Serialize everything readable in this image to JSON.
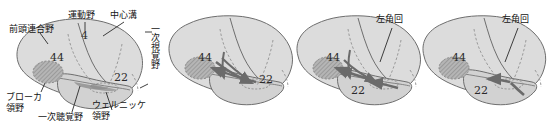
{
  "figure": {
    "title": "",
    "colors": {
      "cortex_fill": "#dcdcdc",
      "cortex_stroke": "#6e6e6e",
      "temporal_fill": "#d2d2d2",
      "broca_fill": "#a8a8a8",
      "broca_stroke": "#8a8a8a",
      "arrow": "#6b6b6b",
      "sulcus_dashed": "#9a9a9a",
      "leader_line": "#2a2a2a",
      "text": "#141414",
      "background": "#ffffff"
    }
  },
  "panels": [
    {
      "id": "panel-1",
      "name": "labeled-brain-anatomy",
      "labels": {
        "frontal_association": "前頭連合野",
        "motor": "運動野",
        "central_sulcus": "中心溝",
        "primary_visual": "一次視覚野",
        "broca": "ブローカ\n領野",
        "primary_auditory": "一次聴覚野",
        "wernicke": "ウェルニッケ\n領野"
      },
      "numbers": {
        "area_4": "4",
        "area_44": "44",
        "area_22": "22"
      }
    },
    {
      "id": "panel-2",
      "name": "brain-hearing-speech-flow",
      "labels": {},
      "numbers": {
        "area_44": "44",
        "area_22": "22"
      }
    },
    {
      "id": "panel-3",
      "name": "brain-reading-flow",
      "labels": {
        "angular_gyrus": "左角回"
      },
      "numbers": {
        "area_44": "44",
        "area_22": "22"
      }
    },
    {
      "id": "panel-4",
      "name": "brain-angular-to-wernicke-flow",
      "labels": {
        "angular_gyrus": "左角回"
      },
      "numbers": {
        "area_44": "44",
        "area_22": "22"
      }
    }
  ]
}
